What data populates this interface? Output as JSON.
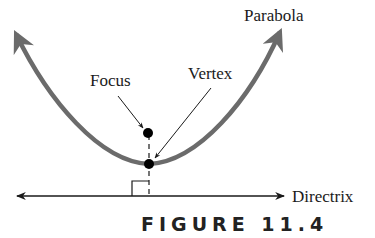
{
  "labels": {
    "parabola": "Parabola",
    "focus": "Focus",
    "vertex": "Vertex",
    "directrix": "Directrix"
  },
  "caption": "FIGURE 11.4",
  "colors": {
    "curve": "#6b6b6b",
    "lines": "#1a1a1a",
    "points": "#000000",
    "background": "#ffffff"
  }
}
